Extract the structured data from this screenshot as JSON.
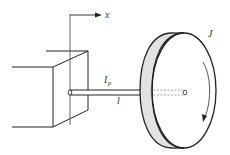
{
  "diagram": {
    "labels": {
      "x_axis": "x",
      "polar_inertia_main": "I",
      "polar_inertia_sub": "p",
      "length": "l",
      "moment_of_inertia": "J"
    },
    "elements": [
      {
        "id": "fixed-block",
        "description": "Rigid support block drawn in oblique projection"
      },
      {
        "id": "x-axis",
        "description": "Vertical reference line with arrow pointing right labeled x"
      },
      {
        "id": "shaft",
        "description": "Cylindrical shaft from block to disc"
      },
      {
        "id": "disc",
        "description": "Rigid disc with grey rim, dashed hidden shaft to center"
      },
      {
        "id": "rotation-arrow",
        "description": "Curved arrow indicating rotation direction"
      }
    ],
    "colors": {
      "stroke": "#222222",
      "rim_fill": "#e2e2e2",
      "dashed": "#888888",
      "axis_line": "#555555"
    }
  }
}
